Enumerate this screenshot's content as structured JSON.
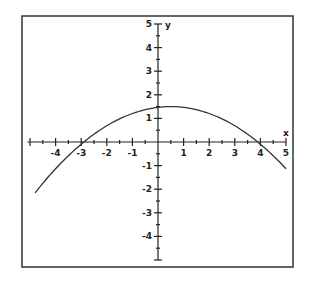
{
  "chart_data": {
    "type": "line",
    "title": "",
    "xlabel": "x",
    "ylabel": "y",
    "xlim": [
      -5,
      5
    ],
    "ylim": [
      -5,
      5
    ],
    "x_ticks": [
      "-4",
      "-3",
      "-2",
      "-1",
      "1",
      "2",
      "3",
      "4",
      "5"
    ],
    "y_ticks": [
      "5",
      "4",
      "3",
      "2",
      "1",
      "-1",
      "-2",
      "-3",
      "-4"
    ],
    "series": [
      {
        "name": "parabola",
        "equation": "y ≈ 1.5 - 0.13(x - 0.5)^2",
        "x": [
          -4.8,
          -4,
          -3,
          -2,
          -1,
          0,
          0.5,
          1,
          2,
          3,
          4,
          5
        ],
        "values": [
          -2.2,
          -1.13,
          -0.09,
          0.69,
          1.21,
          1.47,
          1.5,
          1.47,
          1.21,
          0.69,
          -0.09,
          -1.13
        ]
      }
    ],
    "grid": false
  }
}
